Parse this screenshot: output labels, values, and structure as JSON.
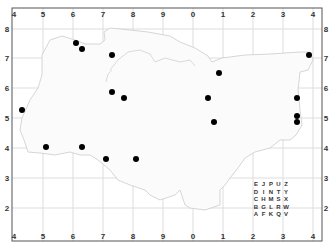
{
  "map": {
    "type": "grid-reference-map",
    "frame": {
      "left": 12,
      "top": 8,
      "right": 322,
      "bottom": 241
    },
    "colors": {
      "background": "#ffffff",
      "frame": "#555555",
      "grid": "#dddddd",
      "coastline": "#cccccc",
      "marker": "#000000",
      "label": "#333333"
    },
    "top_axis_labels": [
      "4",
      "5",
      "6",
      "7",
      "8",
      "9",
      "0",
      "1",
      "2",
      "3",
      "4"
    ],
    "bottom_axis_labels": [
      "4",
      "5",
      "6",
      "7",
      "8",
      "9",
      "0",
      "1",
      "2",
      "3",
      "4"
    ],
    "left_axis_labels": [
      "4",
      "8",
      "7",
      "6",
      "5",
      "4",
      "3",
      "2",
      "4"
    ],
    "right_axis_labels": [
      "4",
      "8",
      "7",
      "6",
      "5",
      "4",
      "3",
      "2",
      "4"
    ],
    "x_grid_px": [
      14,
      43,
      73,
      103,
      133,
      163,
      193,
      223,
      253,
      283,
      313
    ],
    "y_grid_px": [
      29,
      58,
      88,
      118,
      148,
      178,
      208
    ],
    "markers": [
      {
        "x": 22,
        "y": 110
      },
      {
        "x": 76,
        "y": 43
      },
      {
        "x": 82,
        "y": 49
      },
      {
        "x": 112,
        "y": 55
      },
      {
        "x": 112,
        "y": 92
      },
      {
        "x": 124,
        "y": 98
      },
      {
        "x": 46,
        "y": 147
      },
      {
        "x": 82,
        "y": 147
      },
      {
        "x": 106,
        "y": 159
      },
      {
        "x": 136,
        "y": 159
      },
      {
        "x": 219,
        "y": 73
      },
      {
        "x": 208,
        "y": 98
      },
      {
        "x": 214,
        "y": 122
      },
      {
        "x": 309,
        "y": 55
      },
      {
        "x": 297,
        "y": 98
      },
      {
        "x": 297,
        "y": 116
      },
      {
        "x": 297,
        "y": 122
      }
    ],
    "legend_grid": [
      [
        "E",
        "J",
        "P",
        "U",
        "Z"
      ],
      [
        "D",
        "I",
        "N",
        "T",
        "Y"
      ],
      [
        "C",
        "H",
        "M",
        "S",
        "X"
      ],
      [
        "B",
        "G",
        "L",
        "R",
        "W"
      ],
      [
        "A",
        "F",
        "K",
        "Q",
        "V"
      ]
    ]
  }
}
